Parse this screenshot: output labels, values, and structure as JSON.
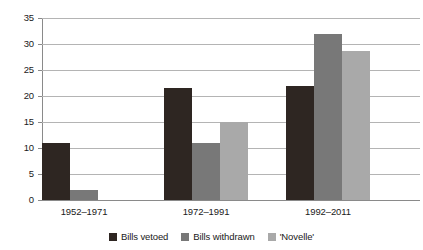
{
  "chart_data": {
    "type": "bar",
    "title": "",
    "xlabel": "",
    "ylabel": "",
    "categories": [
      "1952–1971",
      "1972–1991",
      "1992–2011"
    ],
    "series": [
      {
        "name": "Bills vetoed",
        "color": "#2e2622",
        "values": [
          11,
          21.5,
          22
        ]
      },
      {
        "name": "Bills withdrawn",
        "color": "#787878",
        "values": [
          2,
          11,
          32
        ]
      },
      {
        "name": "'Novelle'",
        "color": "#a9a9a9",
        "values": [
          0,
          15,
          28.7
        ]
      }
    ],
    "ylim": [
      0,
      35
    ],
    "yticks": [
      0,
      5,
      10,
      15,
      20,
      25,
      30,
      35
    ],
    "ytick_labels": [
      "0",
      "5",
      "10",
      "15",
      "20",
      "25",
      "30",
      "35"
    ],
    "grid": true,
    "legend_position": "bottom"
  }
}
